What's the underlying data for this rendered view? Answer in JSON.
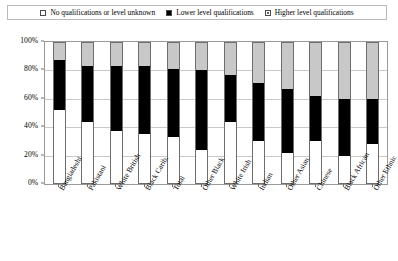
{
  "legend": {
    "items": [
      {
        "label": "No qualifications or level unknown",
        "icon": "empty-square-icon",
        "color": "#ffffff"
      },
      {
        "label": "Lower level qualifications",
        "icon": "filled-square-icon",
        "color": "#000000"
      },
      {
        "label": "Higher level qualifications",
        "icon": "gray-square-icon",
        "color": "#c8c8c8"
      }
    ]
  },
  "chart_data": {
    "type": "bar",
    "title": "",
    "xlabel": "",
    "ylabel": "",
    "ylim": [
      0,
      100
    ],
    "grid": true,
    "stacked": true,
    "stack_total": 100,
    "legend_position": "top",
    "ytick_labels": [
      "0%",
      "20%",
      "40%",
      "60%",
      "80%",
      "100%"
    ],
    "ytick_values": [
      0,
      20,
      40,
      60,
      80,
      100
    ],
    "categories": [
      "Bangladeshi",
      "Pakistani",
      "White British",
      "Black Carib.",
      "Total",
      "Other Black",
      "White Irish",
      "Indian",
      "Other Asian",
      "Chinese",
      "Black African",
      "Other Ethnic"
    ],
    "series": [
      {
        "name": "No qualifications or level unknown",
        "color": "#ffffff",
        "values": [
          52,
          44,
          37,
          35,
          33,
          24,
          44,
          30,
          22,
          30,
          20,
          28
        ]
      },
      {
        "name": "Lower level qualifications",
        "color": "#000000",
        "values": [
          35,
          39,
          46,
          48,
          48,
          56,
          33,
          41,
          45,
          32,
          40,
          32
        ]
      },
      {
        "name": "Higher level qualifications",
        "color": "#c8c8c8",
        "values": [
          13,
          17,
          17,
          17,
          19,
          20,
          23,
          29,
          33,
          38,
          40,
          40
        ]
      }
    ]
  }
}
